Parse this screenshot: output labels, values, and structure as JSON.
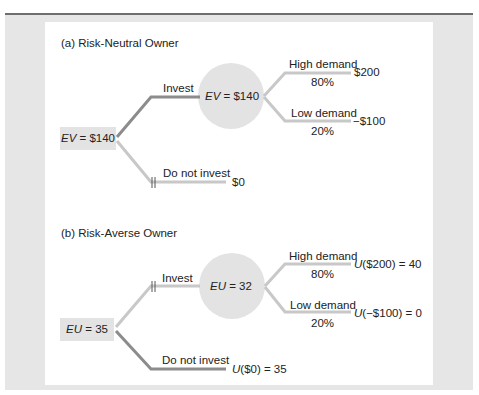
{
  "colors": {
    "frame_bg": "#e6e6e6",
    "panel_bg": "#ffffff",
    "node_fill": "#e3e3e3",
    "chosen_branch": "#8c8c8c",
    "other_branch": "#c8c8c8"
  },
  "panel_a": {
    "title": "(a) Risk-Neutral Owner",
    "root": {
      "var": "EV",
      "eq": " = $140"
    },
    "invest_label": "Invest",
    "chance_node": {
      "var": "EV",
      "eq": " = $140"
    },
    "high": {
      "label": "High demand",
      "prob": "80%",
      "payoff": "$200"
    },
    "low": {
      "label": "Low demand",
      "prob": "20%",
      "payoff": "−$100"
    },
    "no_invest": {
      "label": "Do not invest",
      "payoff": "$0"
    },
    "chosen": "Invest"
  },
  "panel_b": {
    "title": "(b) Risk-Averse Owner",
    "root": {
      "var": "EU",
      "eq": " = 35"
    },
    "invest_label": "Invest",
    "chance_node": {
      "var": "EU",
      "eq": " = 32"
    },
    "high": {
      "label": "High demand",
      "prob": "80%",
      "payoff_fn": "U",
      "payoff_rest": "($200) = 40"
    },
    "low": {
      "label": "Low demand",
      "prob": "20%",
      "payoff_fn": "U",
      "payoff_rest": "(−$100) = 0"
    },
    "no_invest": {
      "label": "Do not invest",
      "payoff_fn": "U",
      "payoff_rest": "($0) = 35"
    },
    "chosen": "Do not invest"
  }
}
